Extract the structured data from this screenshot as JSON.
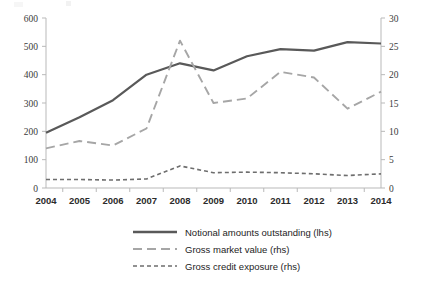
{
  "chart_data": {
    "type": "line",
    "title": "",
    "subtitle": "",
    "xlabel": "",
    "ylabel": "",
    "categories": [
      "2004",
      "2005",
      "2006",
      "2007",
      "2008",
      "2009",
      "2010",
      "2011",
      "2012",
      "2013",
      "2014"
    ],
    "x": [
      2004,
      2005,
      2006,
      2007,
      2008,
      2009,
      2010,
      2011,
      2012,
      2013,
      2014
    ],
    "grid": false,
    "legend_position": "bottom",
    "axes": {
      "left": {
        "label": "",
        "ylim": [
          0,
          600
        ],
        "ticks": [
          0,
          100,
          200,
          300,
          400,
          500,
          600
        ],
        "tick_labels": [
          "0",
          "100",
          "200",
          "300",
          "400",
          "500",
          "600"
        ]
      },
      "right": {
        "label": "",
        "ylim": [
          0,
          30
        ],
        "ticks": [
          0,
          5,
          10,
          15,
          20,
          25,
          30
        ],
        "tick_labels": [
          "0",
          "5",
          "10",
          "15",
          "20",
          "25",
          "30"
        ]
      }
    },
    "series": [
      {
        "name": "Notional amounts outstanding (lhs)",
        "axis": "left",
        "style": "solid",
        "color": "#595959",
        "width": 2.2,
        "values": [
          195,
          250,
          310,
          400,
          440,
          415,
          465,
          490,
          485,
          515,
          510
        ]
      },
      {
        "name": "Gross market value (rhs)",
        "axis": "right",
        "style": "long-dash",
        "color": "#a6a6a6",
        "width": 1.9,
        "dash": "9,5",
        "values": [
          7.0,
          8.3,
          7.5,
          10.5,
          26.0,
          15.0,
          15.8,
          20.5,
          19.5,
          14.0,
          17.0
        ]
      },
      {
        "name": "Gross credit exposure (rhs)",
        "axis": "right",
        "style": "short-dash",
        "color": "#6e6e6e",
        "width": 1.6,
        "dash": "4,3",
        "values": [
          1.5,
          1.5,
          1.4,
          1.6,
          3.9,
          2.7,
          2.8,
          2.7,
          2.5,
          2.2,
          2.5
        ]
      }
    ]
  },
  "legend": {
    "items": [
      {
        "label": "Notional amounts outstanding (lhs)",
        "swatch": "solid-line-swatch"
      },
      {
        "label": "Gross market value (rhs)",
        "swatch": "long-dash-line-swatch"
      },
      {
        "label": "Gross credit exposure (rhs)",
        "swatch": "short-dash-line-swatch"
      }
    ]
  },
  "colors": {
    "notional": "#595959",
    "gross_market_value": "#a6a6a6",
    "gross_credit_exposure": "#6e6e6e",
    "axis": "#b9b9b9",
    "text": "#1d1d1d",
    "background": "#ffffff"
  }
}
